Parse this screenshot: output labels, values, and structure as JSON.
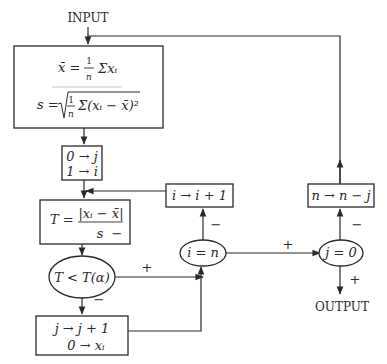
{
  "diagram": {
    "type": "flowchart",
    "nodes": {
      "input": {
        "label": "INPUT"
      },
      "output": {
        "label": "OUTPUT"
      },
      "stats_box": {
        "mean_formula": "x̄ = (1/n) Σ xᵢ",
        "mean_lhs": "x̄ =",
        "mean_num": "1",
        "mean_den": "n",
        "mean_rhs": "Σxᵢ",
        "sd_formula": "s = √((1/n) Σ(xᵢ − x̄)²)",
        "sd_lhs": "s =",
        "sd_num": "1",
        "sd_den": "n",
        "sd_rhs": "Σ(xᵢ − x̄)²"
      },
      "init_box": {
        "line1": "0 → j",
        "line2": "1 → i"
      },
      "t_box": {
        "formula": "T = |xᵢ − x̄| / s",
        "lhs": "T =",
        "num": "|xᵢ − x̄|",
        "den": "s",
        "sign": "−"
      },
      "t_compare": {
        "label": "T < T(α)"
      },
      "j_increment_box": {
        "line1": "j → j + 1",
        "line2": "0 → xᵢ"
      },
      "i_equals_n": {
        "label": "i = n"
      },
      "i_increment_box": {
        "label": "i → i + 1"
      },
      "j_equals_zero": {
        "label": "j = 0"
      },
      "n_update_box": {
        "label": "n → n − j"
      }
    },
    "edge_labels": {
      "t_compare_plus": "+",
      "t_compare_minus": "−",
      "i_equals_n_plus": "+",
      "i_equals_n_minus": "−",
      "j_equals_zero_plus": "+",
      "j_equals_zero_minus": "−"
    },
    "edges": [
      {
        "from": "input",
        "to": "stats_box"
      },
      {
        "from": "stats_box",
        "to": "init_box"
      },
      {
        "from": "init_box",
        "to": "t_box"
      },
      {
        "from": "t_box",
        "to": "t_compare"
      },
      {
        "from": "t_compare",
        "to": "i_equals_n",
        "label": "+"
      },
      {
        "from": "t_compare",
        "to": "j_increment_box",
        "label": "−"
      },
      {
        "from": "j_increment_box",
        "to": "i_equals_n"
      },
      {
        "from": "i_equals_n",
        "to": "i_increment_box",
        "label": "−"
      },
      {
        "from": "i_increment_box",
        "to": "t_box"
      },
      {
        "from": "i_equals_n",
        "to": "j_equals_zero",
        "label": "+"
      },
      {
        "from": "j_equals_zero",
        "to": "n_update_box",
        "label": "−"
      },
      {
        "from": "j_equals_zero",
        "to": "output",
        "label": "+"
      },
      {
        "from": "n_update_box",
        "to": "stats_box"
      }
    ]
  }
}
